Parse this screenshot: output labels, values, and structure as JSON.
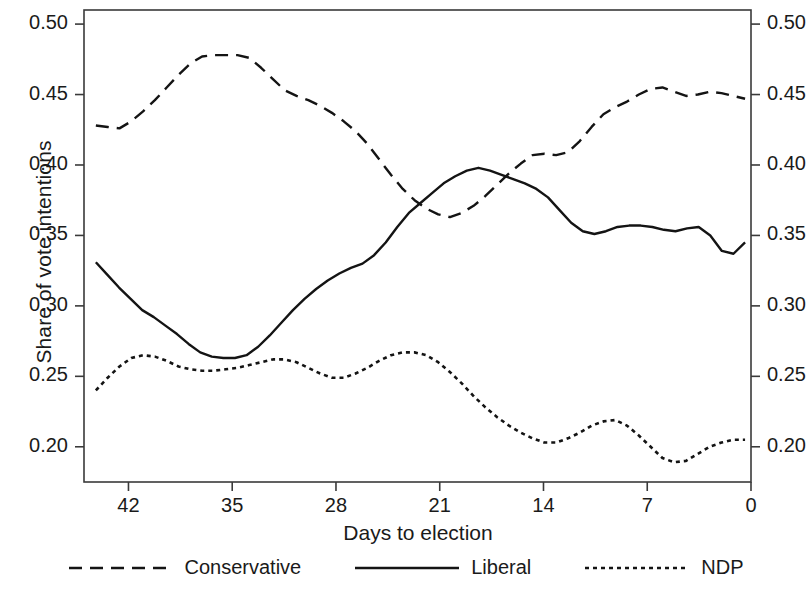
{
  "chart_data": {
    "type": "line",
    "title": "",
    "xlabel": "Days to election",
    "ylabel": "Share of vote intentions",
    "xlim": [
      45,
      0
    ],
    "ylim": [
      0.175,
      0.51
    ],
    "x_reversed": true,
    "grid": false,
    "legend_position": "bottom",
    "xticks": [
      "42",
      "35",
      "28",
      "21",
      "14",
      "7",
      "0"
    ],
    "xtick_values": [
      42,
      35,
      28,
      21,
      14,
      7,
      0
    ],
    "yticks": [
      "0.50",
      "0.45",
      "0.40",
      "0.35",
      "0.30",
      "0.25",
      "0.20"
    ],
    "ytick_values": [
      0.5,
      0.45,
      0.4,
      0.35,
      0.3,
      0.25,
      0.2
    ],
    "right_axis_ticks": [
      "0.50",
      "0.45",
      "0.40",
      "0.35",
      "0.30",
      "0.25",
      "0.20"
    ],
    "x": [
      44.2,
      43.0,
      42.0,
      41.0,
      40.0,
      39.0,
      38.0,
      37.0,
      36.0,
      35.0,
      34.0,
      33.0,
      32.0,
      31.0,
      30.0,
      29.0,
      28.0,
      27.0,
      26.0,
      25.0,
      24.0,
      23.0,
      22.0,
      21.0,
      20.0,
      19.0,
      18.0,
      17.0,
      16.0,
      15.0,
      14.0,
      13.0,
      12.0,
      11.0,
      10.0,
      9.0,
      8.0,
      7.0,
      6.0,
      5.0,
      4.0,
      3.0,
      2.0,
      1.0,
      0.4
    ],
    "series": [
      {
        "name": "Conservative",
        "style": "dashed",
        "color": "#141414",
        "values": [
          0.428,
          0.427,
          0.426,
          0.431,
          0.438,
          0.446,
          0.455,
          0.464,
          0.472,
          0.477,
          0.478,
          0.478,
          0.478,
          0.476,
          0.469,
          0.461,
          0.453,
          0.449,
          0.446,
          0.442,
          0.437,
          0.431,
          0.424,
          0.415,
          0.404,
          0.393,
          0.383,
          0.375,
          0.369,
          0.365,
          0.363,
          0.366,
          0.371,
          0.378,
          0.386,
          0.394,
          0.401,
          0.407,
          0.408,
          0.407,
          0.409,
          0.417,
          0.427,
          0.436,
          0.441
        ]
      },
      {
        "name": "Liberal",
        "style": "solid",
        "color": "#141414",
        "values": [
          0.331,
          0.322,
          0.313,
          0.305,
          0.297,
          0.292,
          0.286,
          0.28,
          0.273,
          0.267,
          0.264,
          0.263,
          0.263,
          0.265,
          0.271,
          0.279,
          0.288,
          0.297,
          0.305,
          0.312,
          0.318,
          0.323,
          0.327,
          0.33,
          0.336,
          0.345,
          0.356,
          0.366,
          0.373,
          0.38,
          0.387,
          0.392,
          0.396,
          0.398,
          0.396,
          0.393,
          0.39,
          0.387,
          0.383,
          0.377,
          0.368,
          0.359,
          0.353,
          0.351,
          0.353
        ]
      },
      {
        "name": "NDP",
        "style": "dotted",
        "color": "#141414",
        "values": [
          0.24,
          0.249,
          0.257,
          0.263,
          0.265,
          0.264,
          0.261,
          0.257,
          0.255,
          0.254,
          0.254,
          0.255,
          0.256,
          0.258,
          0.26,
          0.262,
          0.262,
          0.26,
          0.256,
          0.252,
          0.249,
          0.249,
          0.252,
          0.256,
          0.261,
          0.265,
          0.267,
          0.267,
          0.265,
          0.26,
          0.253,
          0.245,
          0.236,
          0.228,
          0.221,
          0.215,
          0.21,
          0.206,
          0.203,
          0.203,
          0.206,
          0.21,
          0.215,
          0.218,
          0.219
        ]
      }
    ],
    "series_late": [
      {
        "name": "Conservative",
        "values_tail": [
          0.441,
          0.445,
          0.45,
          0.454,
          0.455,
          0.452,
          0.449,
          0.45,
          0.452,
          0.451,
          0.449,
          0.447
        ]
      },
      {
        "name": "Liberal",
        "values_tail": [
          0.353,
          0.356,
          0.357,
          0.357,
          0.356,
          0.354,
          0.353,
          0.355,
          0.356,
          0.35,
          0.339,
          0.337,
          0.345
        ]
      },
      {
        "name": "NDP",
        "values_tail": [
          0.219,
          0.215,
          0.208,
          0.2,
          0.192,
          0.189,
          0.19,
          0.195,
          0.2,
          0.203,
          0.205,
          0.205
        ]
      }
    ]
  },
  "legend": {
    "items": [
      {
        "label": "Conservative",
        "style": "dashed"
      },
      {
        "label": "Liberal",
        "style": "solid"
      },
      {
        "label": "NDP",
        "style": "dotted"
      }
    ]
  },
  "axes": {
    "ylabel": "Share of vote intentions",
    "xlabel": "Days to election"
  }
}
